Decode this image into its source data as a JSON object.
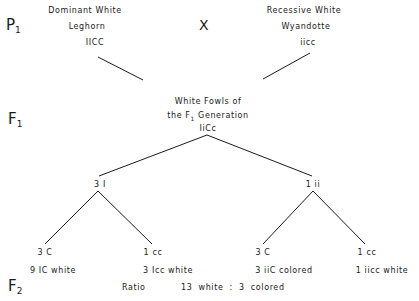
{
  "generations": {
    "p1": {
      "letter": "P",
      "sub": "1"
    },
    "f1": {
      "letter": "F",
      "sub": "1"
    },
    "f2": {
      "letter": "F",
      "sub": "2"
    }
  },
  "cross_symbol": "X",
  "parents": {
    "left": {
      "line1": "Dominant White",
      "line2": "Leghorn",
      "genotype": "IICC"
    },
    "right": {
      "line1": "Recessive White",
      "line2": "Wyandotte",
      "genotype": "iicc"
    }
  },
  "f1": {
    "line1": "White Fowls of",
    "line2_pre": "the F",
    "line2_sub": "1",
    "line2_post": " Generation",
    "genotype": "IiCc"
  },
  "second_level": {
    "left": "3 I",
    "right": "1 ii"
  },
  "third_level": [
    {
      "top": "3 C",
      "bottom": "9 IC white"
    },
    {
      "top": "1 cc",
      "bottom": "3 Icc white"
    },
    {
      "top": "3 C",
      "bottom": "3 iiC colored"
    },
    {
      "top": "1 cc",
      "bottom": "1 iicc white"
    }
  ],
  "ratio": {
    "label": "Ratio",
    "value": "13 white : 3 colored"
  },
  "colors": {
    "ink": "#1a1a1a",
    "background": "#ffffff"
  }
}
